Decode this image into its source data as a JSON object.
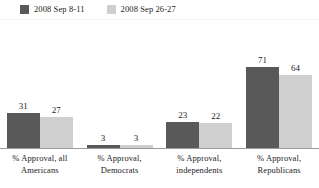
{
  "chart_data": {
    "type": "bar",
    "title": "",
    "xlabel": "",
    "ylabel": "",
    "ylim": [
      0,
      100
    ],
    "grid": false,
    "legend_position": "top-left",
    "categories": [
      "% Approval, all Americans",
      "% Approval, Democrats",
      "% Approval, independents",
      "% Approval, Republicans"
    ],
    "series": [
      {
        "name": "2008 Sep 8-11",
        "color": "#595959",
        "values": [
          31,
          3,
          23,
          71
        ]
      },
      {
        "name": "2008 Sep 26-27",
        "color": "#cfcfcf",
        "values": [
          27,
          3,
          22,
          64
        ]
      }
    ]
  },
  "legend": {
    "entries": [
      {
        "label": "2008 Sep 8-11",
        "color": "#595959"
      },
      {
        "label": "2008 Sep 26-27",
        "color": "#cfcfcf"
      }
    ]
  },
  "axis": {
    "categories": [
      {
        "line1": "% Approval, all",
        "line2": "Americans"
      },
      {
        "line1": "% Approval,",
        "line2": "Democrats"
      },
      {
        "line1": "% Approval,",
        "line2": "independents"
      },
      {
        "line1": "% Approval,",
        "line2": "Republicans"
      }
    ]
  },
  "bars": {
    "g0": {
      "v0": "31",
      "v1": "27"
    },
    "g1": {
      "v0": "3",
      "v1": "3"
    },
    "g2": {
      "v0": "23",
      "v1": "22"
    },
    "g3": {
      "v0": "71",
      "v1": "64"
    }
  }
}
